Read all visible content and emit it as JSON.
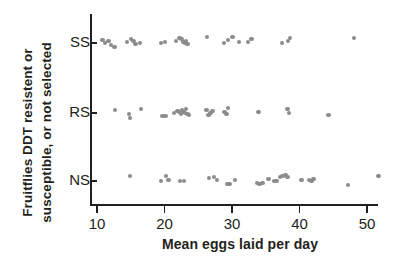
{
  "chart_data": {
    "type": "scatter",
    "title": "",
    "xlabel": "Mean eggs laid per day",
    "ylabel": "Fruitflies DDT resistent or susceptible, or not selected",
    "ylabel_line_1": "Fruitflies DDT resistent or",
    "ylabel_line_2": "susceptible, or not selected",
    "xlim": [
      7.5,
      54.5
    ],
    "xticks": [
      10,
      20,
      30,
      40,
      50
    ],
    "xticklabels": [
      "10",
      "20",
      "30",
      "40",
      "50"
    ],
    "categories": [
      "SS",
      "RS",
      "NS"
    ],
    "grid": false,
    "legend": false,
    "marker_color": "#8a8c8e",
    "axis_color": "#231f20",
    "series": [
      {
        "name": "SS",
        "category": "SS",
        "x": [
          10.8,
          11.2,
          11.7,
          12.1,
          12.6,
          14.4,
          15.0,
          15.4,
          15.7,
          16.4,
          19.5,
          20.1,
          21.7,
          22.2,
          22.5,
          22.8,
          23.0,
          23.2,
          23.4,
          26.3,
          28.8,
          29.4,
          30.1,
          31.0,
          32.4,
          32.9,
          37.4,
          38.3,
          38.6,
          48.1
        ],
        "y_jitter": [
          -2,
          1,
          -1,
          3,
          5,
          0,
          -3,
          -1,
          2,
          1,
          1,
          0,
          -1,
          -4,
          -3,
          0,
          1,
          -1,
          2,
          -5,
          1,
          -2,
          -5,
          0,
          0,
          -3,
          1,
          -1,
          -4,
          -4
        ]
      },
      {
        "name": "RS",
        "category": "RS",
        "x": [
          12.7,
          14.7,
          14.9,
          16.5,
          19.6,
          19.9,
          20.2,
          21.4,
          21.9,
          22.2,
          22.4,
          22.6,
          22.8,
          23.0,
          23.2,
          23.4,
          23.6,
          26.2,
          26.5,
          26.8,
          27.1,
          28.9,
          29.2,
          29.4,
          33.9,
          38.2,
          38.4,
          44.3
        ],
        "y_jitter": [
          -2,
          2,
          6,
          -3,
          4,
          4,
          4,
          1,
          -1,
          0,
          2,
          -2,
          0,
          1,
          -3,
          2,
          3,
          -2,
          3,
          1,
          -1,
          0,
          2,
          -4,
          0,
          -3,
          1,
          3
        ]
      },
      {
        "name": "NS",
        "category": "NS",
        "x": [
          14.9,
          19.5,
          20.2,
          20.6,
          22.3,
          22.9,
          26.6,
          27.3,
          27.8,
          29.3,
          29.6,
          30.4,
          33.7,
          34.1,
          34.5,
          35.4,
          36.3,
          36.7,
          37.1,
          37.5,
          37.9,
          38.2,
          40.3,
          41.4,
          41.8,
          42.1,
          47.2,
          51.7
        ],
        "y_jitter": [
          -4,
          1,
          -4,
          0,
          1,
          1,
          -2,
          -3,
          0,
          4,
          4,
          0,
          3,
          4,
          3,
          -1,
          1,
          1,
          -3,
          -4,
          -5,
          -3,
          0,
          0,
          1,
          -1,
          5,
          -4
        ]
      }
    ]
  }
}
